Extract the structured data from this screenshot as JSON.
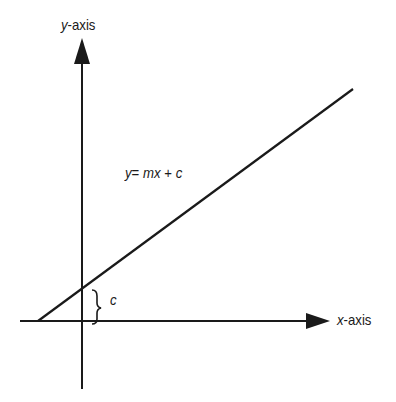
{
  "diagram": {
    "y_axis_label": {
      "var": "y",
      "suffix": "-axis"
    },
    "x_axis_label": {
      "var": "x",
      "suffix": "-axis"
    },
    "equation": {
      "y": "y",
      "eq": "= ",
      "m": "m",
      "x": "x",
      "plus": " + ",
      "c": "c"
    },
    "intercept_label": "c",
    "colors": {
      "stroke": "#1a1a1a",
      "background": "#ffffff"
    }
  }
}
